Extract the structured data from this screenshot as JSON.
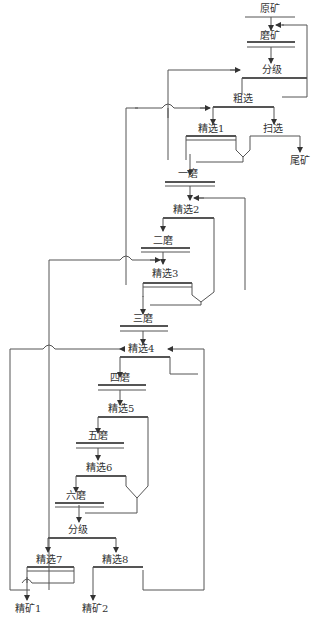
{
  "nodes": {
    "raw_ore": "原矿",
    "grinding": "磨矿",
    "classify1": "分级",
    "rougher": "粗选",
    "cleaner1": "精选1",
    "scavenger": "扫选",
    "tailings": "尾矿",
    "grind1": "一磨",
    "cleaner2": "精选2",
    "grind2": "二磨",
    "cleaner3": "精选3",
    "grind3": "三磨",
    "cleaner4": "精选4",
    "grind4": "四磨",
    "cleaner5": "精选5",
    "grind5": "五磨",
    "cleaner6": "精选6",
    "grind6": "六磨",
    "classify2": "分级",
    "cleaner7": "精选7",
    "cleaner8": "精选8",
    "concentrate1": "精矿1",
    "concentrate2": "精矿2"
  },
  "colors": {
    "line": "#555555",
    "text": "#333333"
  }
}
